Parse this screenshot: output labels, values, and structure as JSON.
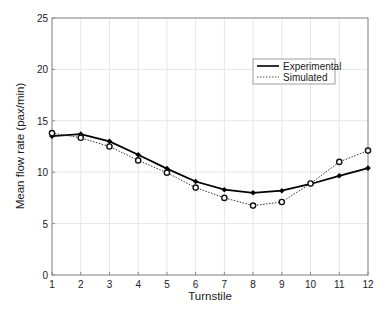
{
  "chart_data": {
    "type": "line",
    "title": "",
    "xlabel": "Turnstile",
    "ylabel": "Mean flow rate (pax/min)",
    "x": [
      1,
      2,
      3,
      4,
      5,
      6,
      7,
      8,
      9,
      10,
      11,
      12
    ],
    "xticks": [
      "1",
      "2",
      "3",
      "4",
      "5",
      "6",
      "7",
      "8",
      "9",
      "10",
      "11",
      "12"
    ],
    "yticks": [
      "0",
      "5",
      "10",
      "15",
      "20",
      "25"
    ],
    "xlim": [
      1,
      12
    ],
    "ylim": [
      0,
      25
    ],
    "grid": true,
    "legend_position": "upper right (inside)",
    "series": [
      {
        "name": "Experimental",
        "style": "solid",
        "marker": "filled-diamond",
        "color": "#000000",
        "values": [
          13.5,
          13.7,
          13.0,
          11.7,
          10.35,
          9.1,
          8.3,
          8.0,
          8.2,
          8.85,
          9.65,
          10.4
        ]
      },
      {
        "name": "Simulated",
        "style": "dotted",
        "marker": "open-circle",
        "color": "#333333",
        "values": [
          13.8,
          13.35,
          12.5,
          11.15,
          9.95,
          8.5,
          7.5,
          6.75,
          7.1,
          8.9,
          11.0,
          12.1
        ]
      }
    ]
  }
}
